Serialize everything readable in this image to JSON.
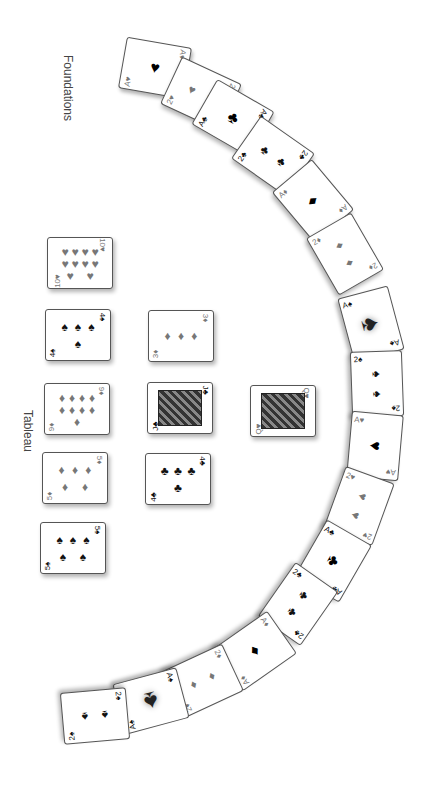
{
  "labels": {
    "foundations": "Foundations",
    "tableau": "Tableau"
  },
  "foundations": [
    {
      "rank": "A",
      "suit": "♥",
      "color": "red",
      "x": 122,
      "y": 42,
      "rot": 100,
      "pips": 1
    },
    {
      "rank": "2",
      "suit": "♥",
      "color": "red",
      "x": 168,
      "y": 68,
      "rot": 115,
      "pips": 2
    },
    {
      "rank": "A",
      "suit": "♣",
      "color": "black",
      "x": 200,
      "y": 92,
      "rot": 120,
      "pips": 1
    },
    {
      "rank": "2",
      "suit": "♣",
      "color": "black",
      "x": 240,
      "y": 130,
      "rot": 125,
      "pips": 2
    },
    {
      "rank": "A",
      "suit": "♦",
      "color": "red",
      "x": 280,
      "y": 175,
      "rot": 140,
      "pips": 1
    },
    {
      "rank": "2",
      "suit": "♦",
      "color": "red",
      "x": 312,
      "y": 228,
      "rot": 150,
      "pips": 2
    },
    {
      "rank": "A",
      "suit": "♠",
      "color": "black",
      "x": 338,
      "y": 298,
      "rot": 165,
      "pips": 1,
      "fancy": true
    },
    {
      "rank": "2",
      "suit": "♠",
      "color": "black",
      "x": 344,
      "y": 358,
      "rot": 178,
      "pips": 2
    },
    {
      "rank": "A",
      "suit": "♥",
      "color": "red",
      "x": 342,
      "y": 420,
      "rot": 185,
      "pips": 1
    },
    {
      "rank": "2",
      "suit": "♥",
      "color": "red",
      "x": 326,
      "y": 480,
      "rot": 200,
      "pips": 2
    },
    {
      "rank": "A",
      "suit": "♣",
      "color": "black",
      "x": 300,
      "y": 535,
      "rot": 210,
      "pips": 1
    },
    {
      "rank": "2",
      "suit": "♣",
      "color": "black",
      "x": 265,
      "y": 578,
      "rot": 215,
      "pips": 2
    },
    {
      "rank": "A",
      "suit": "♦",
      "color": "red",
      "x": 222,
      "y": 625,
      "rot": 235,
      "pips": 1
    },
    {
      "rank": "2",
      "suit": "♦",
      "color": "red",
      "x": 170,
      "y": 655,
      "rot": 245,
      "pips": 2
    },
    {
      "rank": "A",
      "suit": "♠",
      "color": "black",
      "x": 118,
      "y": 675,
      "rot": 255,
      "pips": 1,
      "fancy": true
    },
    {
      "rank": "2",
      "suit": "♠",
      "color": "black",
      "x": 62,
      "y": 690,
      "rot": 265,
      "pips": 2
    }
  ],
  "tableau": [
    {
      "rank": "10",
      "suit": "♥",
      "color": "red",
      "x": 47,
      "y": 237,
      "rot": 0,
      "pips": 10
    },
    {
      "rank": "4",
      "suit": "♠",
      "color": "black",
      "x": 45,
      "y": 309,
      "rot": 0,
      "pips": 4
    },
    {
      "rank": "9",
      "suit": "♦",
      "color": "red",
      "x": 44,
      "y": 383,
      "rot": 0,
      "pips": 9
    },
    {
      "rank": "5",
      "suit": "♦",
      "color": "red",
      "x": 42,
      "y": 452,
      "rot": 0,
      "pips": 5
    },
    {
      "rank": "5",
      "suit": "♠",
      "color": "black",
      "x": 40,
      "y": 522,
      "rot": 0,
      "pips": 5
    },
    {
      "rank": "3",
      "suit": "♦",
      "color": "red",
      "x": 148,
      "y": 310,
      "rot": 0,
      "pips": 3
    },
    {
      "rank": "J",
      "suit": "♣",
      "color": "black",
      "x": 147,
      "y": 382,
      "rot": 0,
      "face": true
    },
    {
      "rank": "4",
      "suit": "♣",
      "color": "black",
      "x": 145,
      "y": 453,
      "rot": 0,
      "pips": 4
    },
    {
      "rank": "Q",
      "suit": "♥",
      "color": "red",
      "x": 250,
      "y": 385,
      "rot": 0,
      "face": true
    }
  ]
}
